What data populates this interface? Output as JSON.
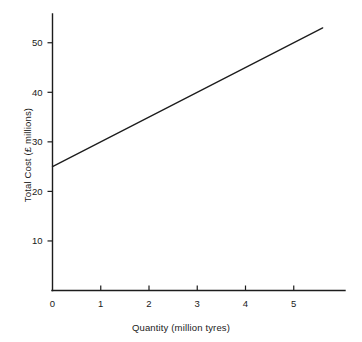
{
  "chart_data": {
    "type": "line",
    "title": "",
    "xlabel": "Quantity (million tyres)",
    "ylabel": "Total Cost (£ millions)",
    "xlim": [
      0,
      6
    ],
    "ylim": [
      0,
      56
    ],
    "grid": false,
    "legend": null,
    "x_ticks": [
      {
        "value": 0,
        "label": "0"
      },
      {
        "value": 1,
        "label": "1"
      },
      {
        "value": 2,
        "label": "2"
      },
      {
        "value": 3,
        "label": "3"
      },
      {
        "value": 4,
        "label": "4"
      },
      {
        "value": 5,
        "label": "5"
      }
    ],
    "y_ticks": [
      {
        "value": 10,
        "label": "10"
      },
      {
        "value": 20,
        "label": "20"
      },
      {
        "value": 30,
        "label": "30"
      },
      {
        "value": 40,
        "label": "40"
      },
      {
        "value": 50,
        "label": "50"
      }
    ],
    "series": [
      {
        "name": "Total Cost",
        "points": [
          {
            "x": 0,
            "y": 25
          },
          {
            "x": 5.6,
            "y": 53
          }
        ]
      }
    ],
    "line_color": "#1c1c1c",
    "axis_color": "#1c1c1c",
    "background_color": "#ffffff"
  }
}
